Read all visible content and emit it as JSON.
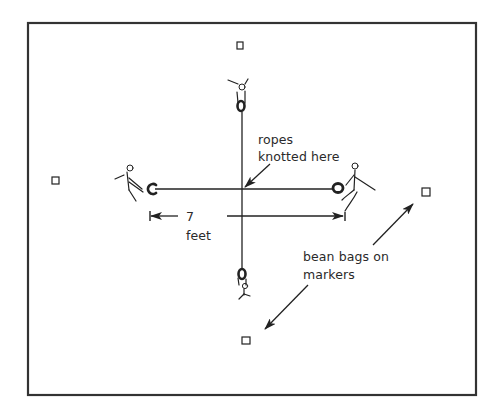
{
  "diagram": {
    "frame": {
      "x": 27,
      "y": 22,
      "width": 449,
      "height": 373,
      "stroke": "#333333"
    },
    "colors": {
      "ink": "#222222",
      "background": "#ffffff"
    },
    "labels": {
      "knot_line1": "ropes",
      "knot_line2": "knotted here",
      "distance_value": "7",
      "distance_unit": "feet",
      "markers_line1": "bean bags on",
      "markers_line2": "markers"
    },
    "ropes": {
      "vertical": {
        "x": 242,
        "y1": 110,
        "y2": 268
      },
      "horizontal": {
        "y": 189,
        "x1": 155,
        "x2": 334
      }
    },
    "players": [
      {
        "id": "top",
        "position": "north",
        "x": 242,
        "y": 92
      },
      {
        "id": "left",
        "position": "west",
        "x": 128,
        "y": 180
      },
      {
        "id": "right",
        "position": "east",
        "x": 352,
        "y": 182
      },
      {
        "id": "bottom",
        "position": "south",
        "x": 242,
        "y": 285
      }
    ],
    "markers": [
      {
        "id": "top",
        "x": 240,
        "y": 45,
        "size": 7,
        "icon": "square-marker-icon"
      },
      {
        "id": "left",
        "x": 56,
        "y": 181,
        "size": 7,
        "icon": "square-marker-icon"
      },
      {
        "id": "right",
        "x": 426,
        "y": 191,
        "size": 8,
        "icon": "square-marker-icon"
      },
      {
        "id": "bottom",
        "x": 245,
        "y": 340,
        "size": 8,
        "icon": "square-marker-icon"
      }
    ],
    "dimension": {
      "distance": 7,
      "unit": "feet",
      "y": 216,
      "x_start": 150,
      "x_end": 345
    }
  }
}
